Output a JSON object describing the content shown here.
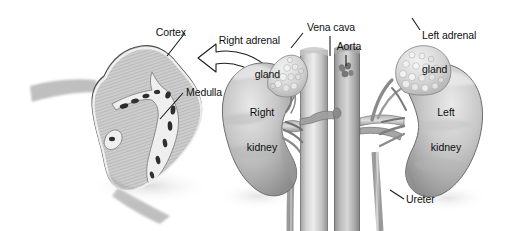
{
  "figure": {
    "background_color": "#ffffff",
    "width": 507,
    "height": 231
  },
  "labels": {
    "cortex": "Cortex",
    "medulla": "Medulla",
    "right_adrenal_gland_line1": "Right adrenal",
    "right_adrenal_gland_line2": "gland",
    "vena_cava": "Vena cava",
    "aorta": "Aorta",
    "left_adrenal_gland_line1": "Left adrenal",
    "left_adrenal_gland_line2": "gland",
    "right_kidney_line1": "Right",
    "right_kidney_line2": "kidney",
    "left_kidney_line1": "Left",
    "left_kidney_line2": "kidney",
    "ureter": "Ureter"
  },
  "colors": {
    "ink": "#101010",
    "leader_line": "#1a1a1a",
    "tissue_light": "#e2e2e2",
    "tissue_mid": "#b9b9b9",
    "tissue_dark": "#8a8a8a",
    "vessel_light": "#d8d8d8",
    "vessel_dark": "#9a9a9a",
    "outline": "#5a5a5a"
  },
  "structures": {
    "cross_section": "adrenal gland cross-section",
    "right_adrenal_gland": "right adrenal gland",
    "left_adrenal_gland": "left adrenal gland",
    "right_kidney": "right kidney",
    "left_kidney": "left kidney",
    "inferior_vena_cava": "inferior vena cava",
    "abdominal_aorta": "abdominal aorta",
    "right_ureter": "right ureter",
    "left_ureter": "left ureter",
    "magnify_arrow": "magnification arrow"
  }
}
